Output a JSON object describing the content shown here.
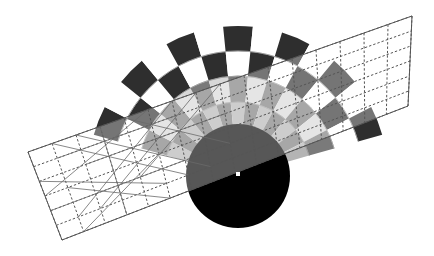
{
  "figure": {
    "canvas": {
      "width": 434,
      "height": 256,
      "background": "#ffffff"
    },
    "palette": {
      "black": "#000000",
      "dark_gray": "#3b3b3b",
      "mid_dark_gray": "#595959",
      "mid_gray": "#7a7a7a",
      "light_gray": "#b4b4b4",
      "pale_gray": "#d8d8d8",
      "white": "#ffffff",
      "grid_line": "#555555",
      "overlay_wash": "rgba(120,120,120,0.42)"
    },
    "fan": {
      "name": "polar-checkerboard-fan",
      "center_x": 238,
      "center_y": 176,
      "inner_radius": 18,
      "outer_radius": 150,
      "start_angle_deg": 196,
      "end_angle_deg": 344,
      "wedge_count": 13,
      "ring_count": 5,
      "ring_radii": [
        18,
        48,
        74,
        100,
        125,
        150
      ],
      "checker_light": "#ffffff",
      "checker_dark": "#2e2e2e",
      "ring_shades": [
        "#6e6e6e",
        "#9a9a9a",
        "#c2c2c2",
        "#8c8c8c",
        "#3a3a3a"
      ]
    },
    "grid_band": {
      "name": "rotated-dashed-grid-band",
      "rotation_deg": -14,
      "corner_top_left_x": 28,
      "corner_top_left_y": 152,
      "corner_top_right_x": 412,
      "corner_top_right_y": 16,
      "corner_bottom_right_x": 408,
      "corner_bottom_right_y": 106,
      "corner_bottom_left_x": 62,
      "corner_bottom_left_y": 240,
      "columns": 16,
      "rows": 6,
      "line_style": "dashed",
      "line_color": "#555555",
      "line_width": 1,
      "diagonals_in_left_cells": true
    },
    "disc": {
      "name": "black-disc",
      "center_x": 238,
      "center_y": 176,
      "radius": 52,
      "fill": "#000000"
    },
    "center_marker": {
      "name": "center-marker",
      "x": 238,
      "y": 174,
      "size": 4,
      "fill": "#ffffff"
    }
  }
}
